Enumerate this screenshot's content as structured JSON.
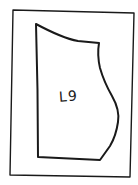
{
  "drawing": {
    "type": "hand-drawn sketch",
    "shape_label": "L9",
    "stroke_color": "#1a1a1a",
    "background_color": "#ffffff",
    "frame": {
      "points": [
        [
          13,
          10
        ],
        [
          134,
          13
        ],
        [
          130,
          177
        ],
        [
          10,
          175
        ]
      ]
    },
    "piece": {
      "description": "pattern piece with curved top edge and curved right side bulge"
    }
  }
}
